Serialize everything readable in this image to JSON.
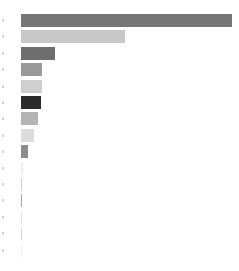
{
  "chart_data": {
    "type": "bar",
    "orientation": "horizontal",
    "title": "",
    "subtitle": "",
    "xlabel": "",
    "ylabel": "",
    "grid": false,
    "legend": false,
    "legend_position": "none",
    "categories": [
      "1",
      "2",
      "3",
      "4",
      "5",
      "6",
      "7",
      "8",
      "9",
      "10",
      "11",
      "12",
      "13",
      "14",
      "15"
    ],
    "values": [
      211,
      104,
      34,
      21,
      21,
      20,
      17,
      13,
      7,
      2,
      1,
      1,
      1,
      1,
      1
    ],
    "xlim": [
      0,
      212
    ],
    "ylim": [
      0,
      15
    ],
    "xtick_labels": [],
    "ytick_labels": [],
    "bar_colors": [
      "#767676",
      "#c8c8c8",
      "#6e6e6e",
      "#9a9a9a",
      "#cfcfcf",
      "#2b2b2b",
      "#b4b4b4",
      "#dcdcdc",
      "#8c8c8c",
      "#ededed",
      "#d2d2d2",
      "#a8a8a8",
      "#e4e4e4",
      "#dadada",
      "#efefef"
    ],
    "bar_height_px": 13,
    "row_pitch_px": 16.4,
    "axis_tick_color": "#d8d8d8",
    "background_color": "#ffffff"
  }
}
